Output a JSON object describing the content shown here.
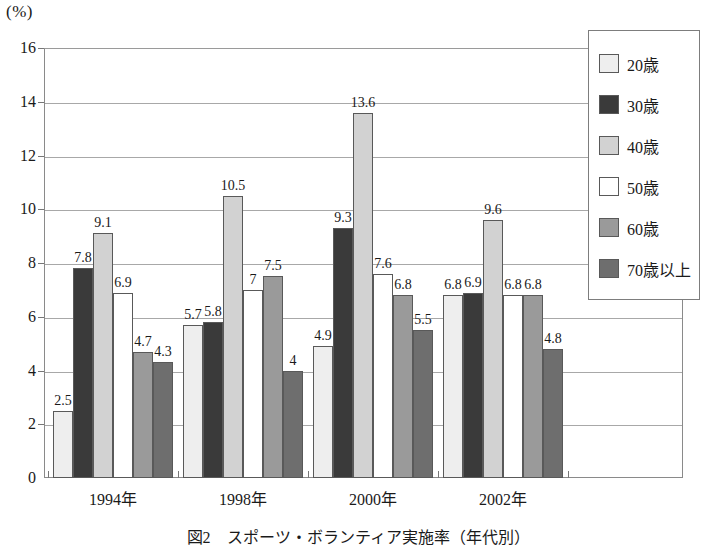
{
  "axis": {
    "unit_label": "(%)",
    "y_ticks": [
      0,
      2,
      4,
      6,
      8,
      10,
      12,
      14,
      16
    ]
  },
  "legend": {
    "items": [
      {
        "label": "20歳",
        "color": "#eeeeee"
      },
      {
        "label": "30歳",
        "color": "#3a3a3a"
      },
      {
        "label": "40歳",
        "color": "#d2d2d2"
      },
      {
        "label": "50歳",
        "color": "#ffffff"
      },
      {
        "label": "60歳",
        "color": "#9a9a9a"
      },
      {
        "label": "70歳以上",
        "color": "#6e6e6e"
      }
    ]
  },
  "caption": "図2　スポーツ・ボランティア実施率（年代別）",
  "chart_data": {
    "type": "bar",
    "title": "図2　スポーツ・ボランティア実施率（年代別）",
    "xlabel": "",
    "ylabel": "(%)",
    "ylim": [
      0,
      16
    ],
    "ytick_step": 2,
    "grid": true,
    "legend_position": "right",
    "categories": [
      "1994年",
      "1998年",
      "2000年",
      "2002年"
    ],
    "series": [
      {
        "name": "20歳",
        "color": "#eeeeee",
        "values": [
          2.5,
          5.7,
          4.9,
          6.8
        ]
      },
      {
        "name": "30歳",
        "color": "#3a3a3a",
        "values": [
          7.8,
          5.8,
          9.3,
          6.9
        ]
      },
      {
        "name": "40歳",
        "color": "#d2d2d2",
        "values": [
          9.1,
          10.5,
          13.6,
          9.6
        ]
      },
      {
        "name": "50歳",
        "color": "#ffffff",
        "values": [
          6.9,
          7,
          7.6,
          6.8
        ]
      },
      {
        "name": "60歳",
        "color": "#9a9a9a",
        "values": [
          4.7,
          7.5,
          6.8,
          6.8
        ]
      },
      {
        "name": "70歳以上",
        "color": "#6e6e6e",
        "values": [
          4.3,
          4,
          5.5,
          4.8
        ]
      }
    ],
    "value_labels": [
      [
        "2.5",
        "7.8",
        "9.1",
        "6.9",
        "4.7",
        "4.3"
      ],
      [
        "5.7",
        "5.8",
        "10.5",
        "7",
        "7.5",
        "4"
      ],
      [
        "4.9",
        "9.3",
        "13.6",
        "7.6",
        "6.8",
        "5.5"
      ],
      [
        "6.8",
        "6.9",
        "9.6",
        "6.8",
        "6.8",
        "4.8"
      ]
    ]
  }
}
